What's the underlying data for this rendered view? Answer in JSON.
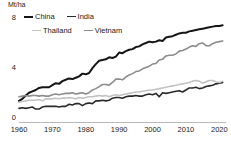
{
  "chart_data": {
    "type": "line",
    "title": "",
    "subtitle": "",
    "xlabel": "",
    "ylabel": "Mt/ha",
    "unit_label": "Mt/ha",
    "xlim": [
      1960,
      2022
    ],
    "ylim": [
      0,
      8
    ],
    "yticks": [
      0,
      4,
      8
    ],
    "ytick_labels": [
      "0",
      "4",
      "8"
    ],
    "xticks": [
      1960,
      1970,
      1980,
      1990,
      2000,
      2010,
      2020
    ],
    "xtick_labels": [
      "1960",
      "1970",
      "1980",
      "1990",
      "2000",
      "2010",
      "2020"
    ],
    "grid": false,
    "legend_position": "top-left",
    "legend": [
      {
        "label": "China",
        "color": "#151515",
        "width": 2.0
      },
      {
        "label": "India",
        "color": "#2a2a2a",
        "width": 1.6
      },
      {
        "label": "Thailand",
        "color": "#c2c2c2",
        "width": 1.6
      },
      {
        "label": "Vietnam",
        "color": "#8c8c8c",
        "width": 1.6
      }
    ],
    "x": [
      1960,
      1961,
      1962,
      1963,
      1964,
      1965,
      1966,
      1967,
      1968,
      1969,
      1970,
      1971,
      1972,
      1973,
      1974,
      1975,
      1976,
      1977,
      1978,
      1979,
      1980,
      1981,
      1982,
      1983,
      1984,
      1985,
      1986,
      1987,
      1988,
      1989,
      1990,
      1991,
      1992,
      1993,
      1994,
      1995,
      1996,
      1997,
      1998,
      1999,
      2000,
      2001,
      2002,
      2003,
      2004,
      2005,
      2006,
      2007,
      2008,
      2009,
      2010,
      2011,
      2012,
      2013,
      2014,
      2015,
      2016,
      2017,
      2018,
      2019,
      2020,
      2021
    ],
    "series": [
      {
        "name": "China",
        "color": "#151515",
        "width": 2.0,
        "values": [
          1.55,
          1.7,
          1.95,
          2.15,
          2.25,
          2.35,
          2.5,
          2.55,
          2.55,
          2.55,
          2.7,
          2.85,
          2.8,
          3.0,
          3.1,
          3.2,
          3.15,
          3.25,
          3.35,
          3.55,
          3.5,
          3.6,
          3.95,
          4.25,
          4.5,
          4.55,
          4.6,
          4.75,
          4.7,
          4.8,
          5.1,
          5.05,
          5.2,
          5.3,
          5.35,
          5.5,
          5.55,
          5.7,
          5.8,
          5.9,
          5.85,
          5.9,
          6.0,
          5.95,
          6.2,
          6.25,
          6.3,
          6.4,
          6.5,
          6.55,
          6.55,
          6.65,
          6.7,
          6.75,
          6.8,
          6.85,
          6.9,
          6.95,
          7.0,
          7.05,
          7.05,
          7.1
        ]
      },
      {
        "name": "Vietnam",
        "color": "#8c8c8c",
        "width": 1.6,
        "values": [
          1.85,
          1.9,
          1.95,
          1.9,
          1.95,
          1.95,
          1.9,
          1.95,
          1.9,
          1.9,
          2.0,
          2.05,
          2.0,
          2.05,
          2.1,
          2.1,
          2.15,
          2.05,
          2.1,
          2.15,
          2.05,
          2.15,
          2.35,
          2.45,
          2.6,
          2.75,
          2.75,
          2.7,
          2.9,
          3.15,
          3.15,
          3.1,
          3.3,
          3.45,
          3.55,
          3.7,
          3.75,
          3.9,
          4.0,
          4.1,
          4.25,
          4.3,
          4.55,
          4.6,
          4.85,
          4.9,
          4.9,
          5.0,
          5.2,
          5.25,
          5.35,
          5.5,
          5.6,
          5.55,
          5.75,
          5.8,
          5.6,
          5.6,
          5.75,
          5.85,
          5.9,
          5.95
        ]
      },
      {
        "name": "India",
        "color": "#2a2a2a",
        "width": 1.6,
        "values": [
          1.0,
          1.05,
          1.0,
          1.05,
          1.1,
          0.95,
          0.95,
          1.1,
          1.15,
          1.15,
          1.15,
          1.15,
          1.1,
          1.15,
          1.15,
          1.3,
          1.25,
          1.35,
          1.35,
          1.2,
          1.35,
          1.4,
          1.35,
          1.55,
          1.55,
          1.6,
          1.55,
          1.6,
          1.75,
          1.8,
          1.8,
          1.75,
          1.85,
          1.9,
          1.9,
          1.95,
          1.9,
          1.9,
          2.0,
          2.05,
          2.0,
          2.1,
          1.85,
          2.15,
          2.1,
          2.15,
          2.2,
          2.25,
          2.3,
          2.2,
          2.35,
          2.5,
          2.5,
          2.55,
          2.45,
          2.5,
          2.6,
          2.65,
          2.7,
          2.8,
          2.85,
          2.9
        ]
      },
      {
        "name": "Thailand",
        "color": "#c2c2c2",
        "width": 1.6,
        "values": [
          1.45,
          1.5,
          1.55,
          1.6,
          1.6,
          1.6,
          1.65,
          1.55,
          1.7,
          1.7,
          1.7,
          1.75,
          1.7,
          1.75,
          1.75,
          1.8,
          1.75,
          1.7,
          1.8,
          1.75,
          1.8,
          1.85,
          1.85,
          1.9,
          1.95,
          1.9,
          1.95,
          1.85,
          1.95,
          2.0,
          1.95,
          2.0,
          2.05,
          2.1,
          2.15,
          2.2,
          2.2,
          2.25,
          2.3,
          2.35,
          2.35,
          2.4,
          2.45,
          2.5,
          2.55,
          2.6,
          2.65,
          2.7,
          2.75,
          2.8,
          2.85,
          2.9,
          3.0,
          3.05,
          3.0,
          2.85,
          2.95,
          3.05,
          3.05,
          2.95,
          2.9,
          3.0
        ]
      }
    ]
  }
}
